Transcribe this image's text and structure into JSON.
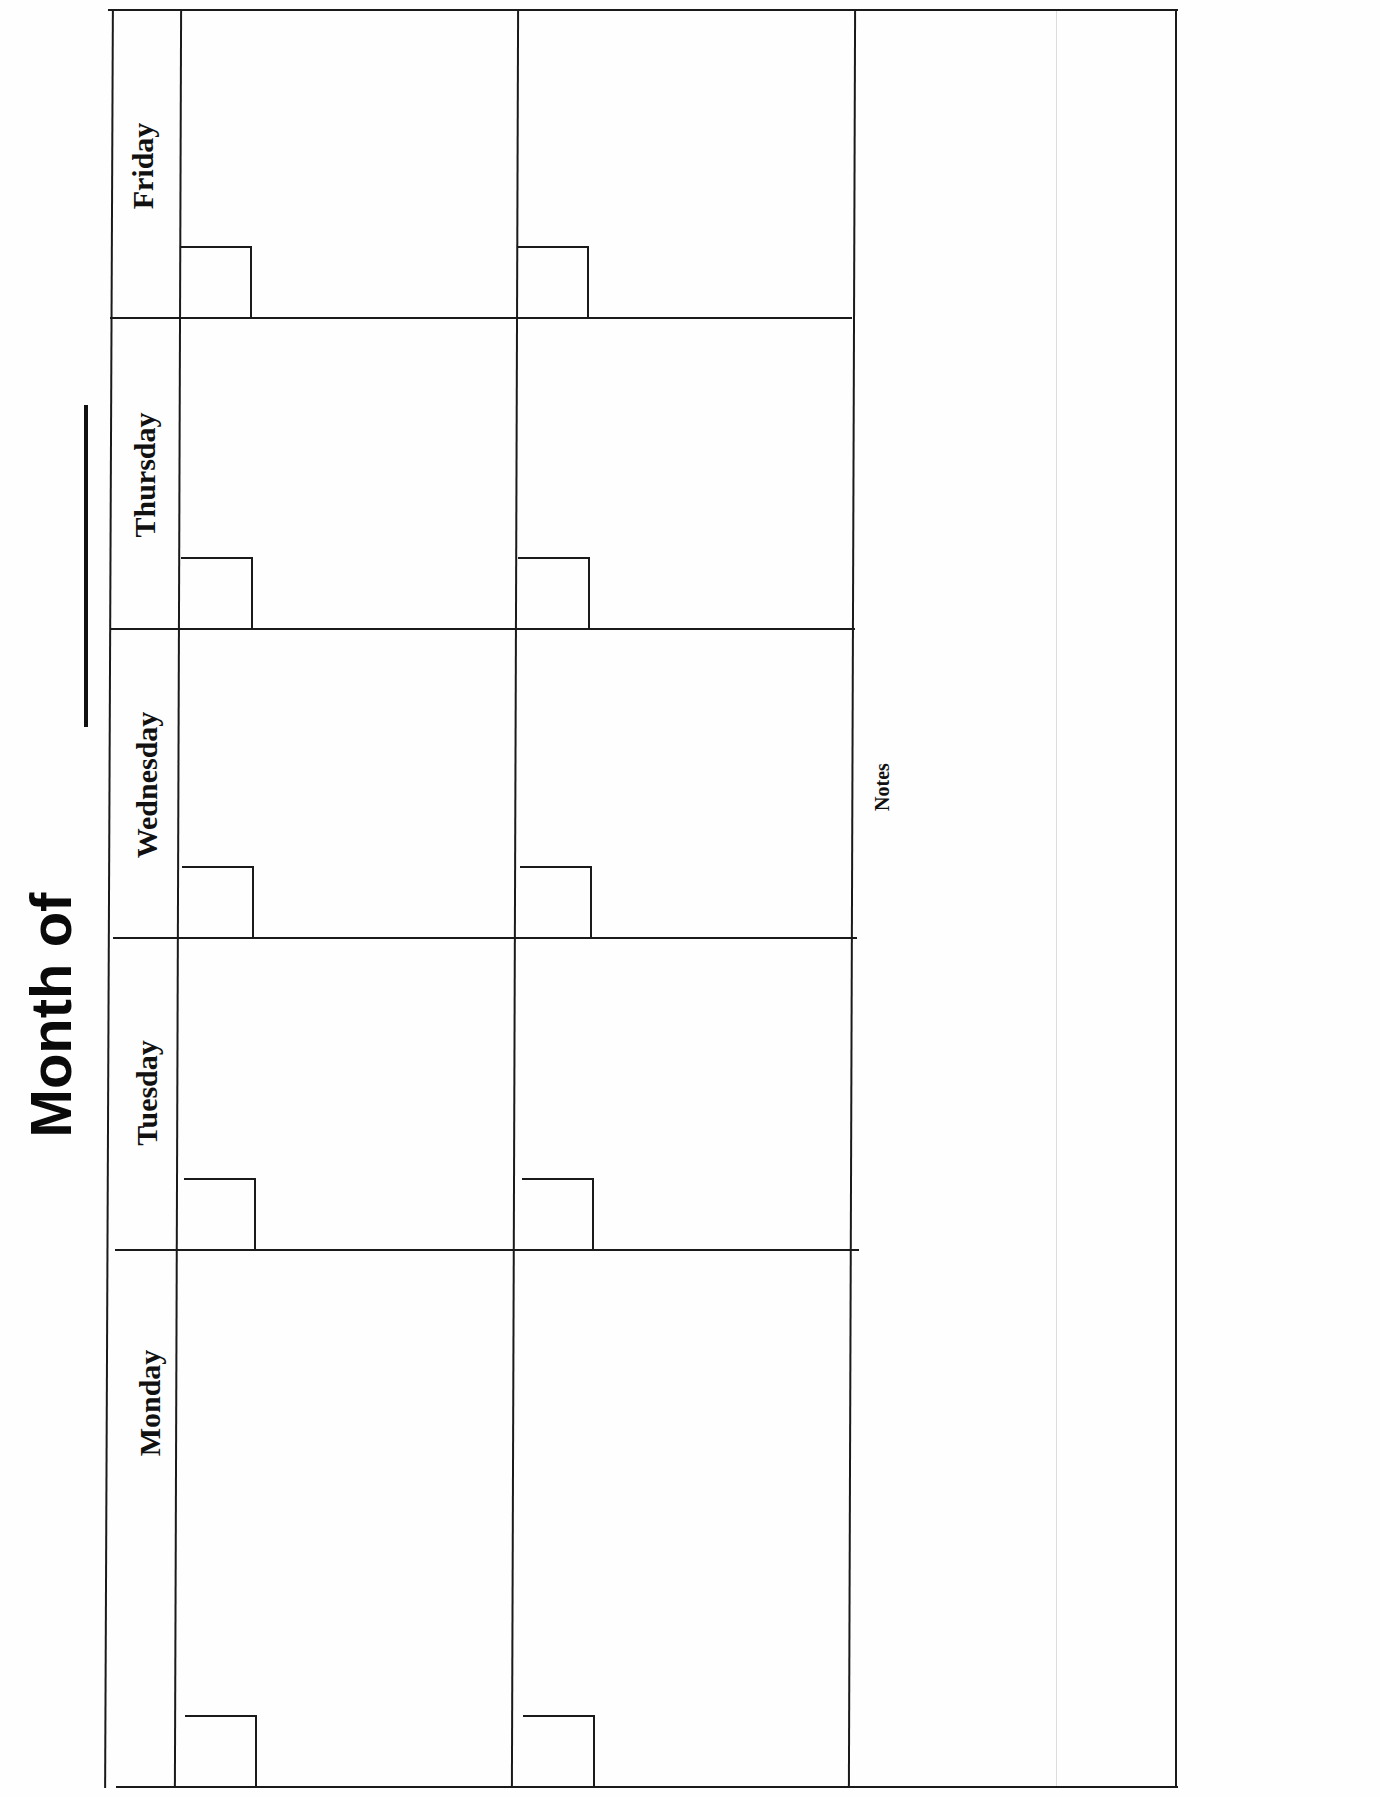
{
  "document": {
    "title": "Month of",
    "title_blank": "________",
    "orientation": "landscape (rotated 90°)",
    "days": [
      {
        "label": "Friday"
      },
      {
        "label": "Thursday"
      },
      {
        "label": "Wednesday"
      },
      {
        "label": "Tuesday"
      },
      {
        "label": "Monday"
      }
    ],
    "weeks": [
      {
        "name": "week-1"
      },
      {
        "name": "week-2"
      }
    ],
    "notes_label": "Notes",
    "colors": {
      "line": "#1a1a1a",
      "background": "#fefefe",
      "text": "#111111"
    }
  }
}
